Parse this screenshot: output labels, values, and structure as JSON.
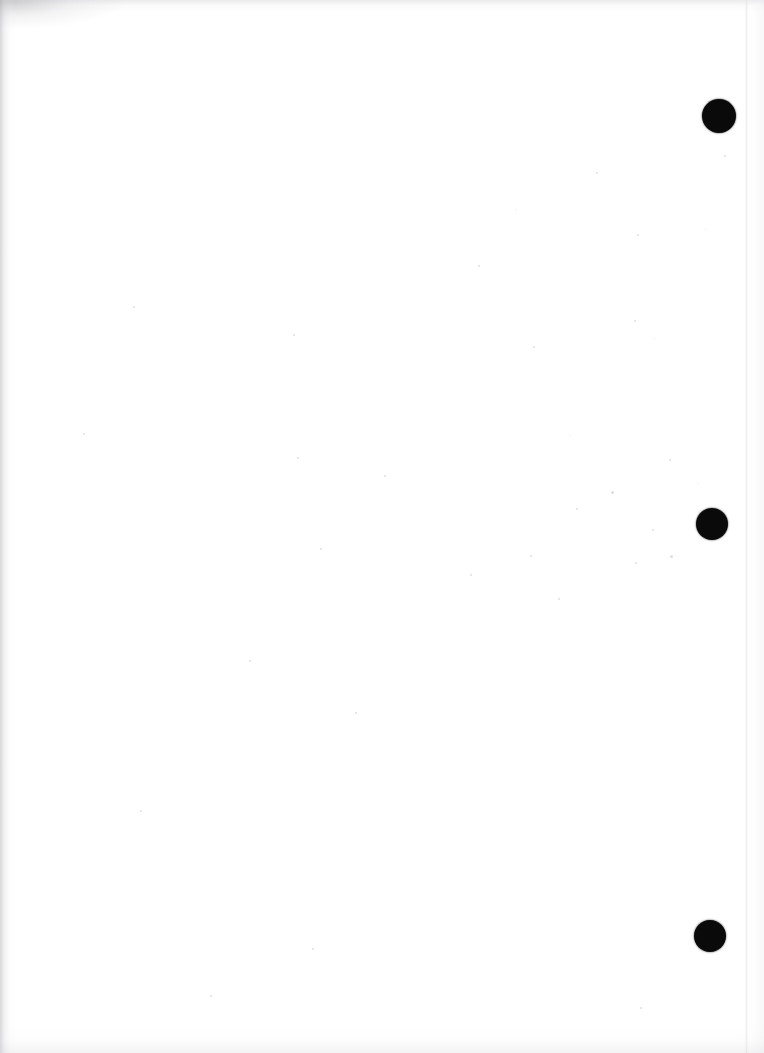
{
  "page": {
    "kind": "scanned-blank-page",
    "width_px": 764,
    "height_px": 1053,
    "background_color": "#ffffff",
    "paper_tone": "#ffffff",
    "text_content": "",
    "visible_text_count": 0
  },
  "marks": {
    "label": "registration-dots",
    "color": "#0a0a0a",
    "count": 3,
    "items": [
      {
        "id": "dot-1",
        "center_x": 719,
        "center_y": 116,
        "radius": 17,
        "diameter": 34
      },
      {
        "id": "dot-2",
        "center_x": 712,
        "center_y": 524,
        "radius": 16,
        "diameter": 32
      },
      {
        "id": "dot-3",
        "center_x": 710,
        "center_y": 936,
        "radius": 16,
        "diameter": 32
      }
    ]
  },
  "artifacts": {
    "left_edge_shadow": {
      "present": true,
      "color": "#b0b0b4",
      "width_px": 16
    },
    "top_left_smudge": {
      "present": true,
      "color": "#96969b"
    },
    "top_scan_band": {
      "present": true,
      "color": "#c4c4c8"
    },
    "bottom_scan_band": {
      "present": true,
      "color": "#d2d2d6"
    },
    "right_page_edge_seam": {
      "present": true,
      "color": "#e2e2e6",
      "x_px": 745
    },
    "speckles": [
      {
        "x": 133,
        "y": 306,
        "size": 2
      },
      {
        "x": 293,
        "y": 334,
        "size": 2
      },
      {
        "x": 533,
        "y": 346,
        "size": 2
      },
      {
        "x": 799,
        "y": 350,
        "size": 1
      },
      {
        "x": 83,
        "y": 433,
        "size": 2
      },
      {
        "x": 570,
        "y": 435,
        "size": 1
      },
      {
        "x": 297,
        "y": 457,
        "size": 2
      },
      {
        "x": 669,
        "y": 459,
        "size": 2
      },
      {
        "x": 384,
        "y": 475,
        "size": 2
      },
      {
        "x": 698,
        "y": 483,
        "size": 1
      },
      {
        "x": 611,
        "y": 491,
        "size": 3
      },
      {
        "x": 576,
        "y": 508,
        "size": 2
      },
      {
        "x": 652,
        "y": 529,
        "size": 2
      },
      {
        "x": 320,
        "y": 548,
        "size": 2
      },
      {
        "x": 530,
        "y": 555,
        "size": 2
      },
      {
        "x": 670,
        "y": 555,
        "size": 3
      },
      {
        "x": 635,
        "y": 562,
        "size": 2
      },
      {
        "x": 470,
        "y": 574,
        "size": 2
      },
      {
        "x": 558,
        "y": 598,
        "size": 2
      },
      {
        "x": 724,
        "y": 155,
        "size": 2
      },
      {
        "x": 596,
        "y": 172,
        "size": 2
      },
      {
        "x": 516,
        "y": 209,
        "size": 1
      },
      {
        "x": 637,
        "y": 234,
        "size": 2
      },
      {
        "x": 705,
        "y": 229,
        "size": 1
      },
      {
        "x": 478,
        "y": 265,
        "size": 2
      },
      {
        "x": 634,
        "y": 320,
        "size": 2
      },
      {
        "x": 654,
        "y": 338,
        "size": 1
      },
      {
        "x": 249,
        "y": 660,
        "size": 2
      },
      {
        "x": 140,
        "y": 810,
        "size": 2
      },
      {
        "x": 355,
        "y": 712,
        "size": 2
      },
      {
        "x": 312,
        "y": 948,
        "size": 2
      },
      {
        "x": 210,
        "y": 995,
        "size": 2
      },
      {
        "x": 640,
        "y": 1007,
        "size": 2
      }
    ]
  }
}
